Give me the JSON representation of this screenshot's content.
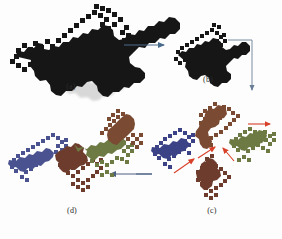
{
  "figure": {
    "type": "fractal-construction-diagram",
    "background_color": "#ffffff",
    "panels": [
      {
        "id": "a",
        "label": "(a)",
        "label_x": 71,
        "label_y": 84,
        "caption_note": "Full-size black dragon curve fractal",
        "pieces": [
          {
            "name": "whole",
            "color": "#161616"
          }
        ]
      },
      {
        "id": "b",
        "label": "(b)",
        "label_x": 208,
        "label_y": 77,
        "caption_note": "Scaled-down black dragon curve fractal",
        "pieces": [
          {
            "name": "whole",
            "color": "#161616"
          }
        ]
      },
      {
        "id": "c",
        "label": "(c)",
        "label_x": 212,
        "label_y": 208,
        "caption_note": "Four rotated colored copies arranged around a center point",
        "pieces": [
          {
            "name": "top-brown",
            "color": "#7a4a33"
          },
          {
            "name": "left-blue",
            "color": "#3b4386"
          },
          {
            "name": "right-green",
            "color": "#6e7a43"
          },
          {
            "name": "bottom-darkbrown",
            "color": "#6d3c2c"
          }
        ]
      },
      {
        "id": "d",
        "label": "(d)",
        "label_x": 72,
        "label_y": 208,
        "caption_note": "The four colored copies merged into one composite dragon curve",
        "pieces": [
          {
            "name": "blue",
            "color": "#4a5390"
          },
          {
            "name": "brown",
            "color": "#7a4a33"
          },
          {
            "name": "green",
            "color": "#6e7a43"
          },
          {
            "name": "darkbrown",
            "color": "#6d3c2c"
          }
        ]
      }
    ],
    "arrows": [
      {
        "name": "arrow-a-to-b",
        "kind": "straight",
        "direction": "right",
        "color": "#4a6b8a",
        "x1": 124,
        "y1": 45,
        "x2": 166,
        "y2": 45
      },
      {
        "name": "arrow-b-to-c",
        "kind": "elbow",
        "direction": "right-then-down",
        "color": "#6a7f96",
        "x1": 228,
        "y1": 40,
        "x2": 252,
        "y2": 40,
        "x3": 252,
        "y3": 92
      },
      {
        "name": "arrow-c-to-d",
        "kind": "straight",
        "direction": "left",
        "color": "#4a5f80",
        "x1": 152,
        "y1": 174,
        "x2": 108,
        "y2": 174
      },
      {
        "name": "arrow-merge-1",
        "kind": "straight",
        "direction": "right",
        "color": "#d8402a",
        "x1": 248,
        "y1": 124,
        "x2": 272,
        "y2": 124
      },
      {
        "name": "arrow-merge-2",
        "kind": "straight",
        "direction": "up-right",
        "color": "#d8402a",
        "x1": 198,
        "y1": 157,
        "x2": 216,
        "y2": 146
      },
      {
        "name": "arrow-merge-3",
        "kind": "straight",
        "direction": "up-right",
        "color": "#d8402a",
        "x1": 176,
        "y1": 172,
        "x2": 196,
        "y2": 158
      },
      {
        "name": "arrow-merge-4",
        "kind": "straight",
        "direction": "up-left",
        "color": "#d8402a",
        "x1": 234,
        "y1": 160,
        "x2": 222,
        "y2": 146
      }
    ],
    "colors": {
      "black": "#161616",
      "blue": "#3b4386",
      "blue_light": "#4a5390",
      "brown": "#7a4a33",
      "dark_brown": "#6d3c2c",
      "green": "#6e7a43",
      "arrow_blue": "#4a6b8a",
      "arrow_red": "#d8402a",
      "label_text": "#2a2a2a"
    }
  }
}
